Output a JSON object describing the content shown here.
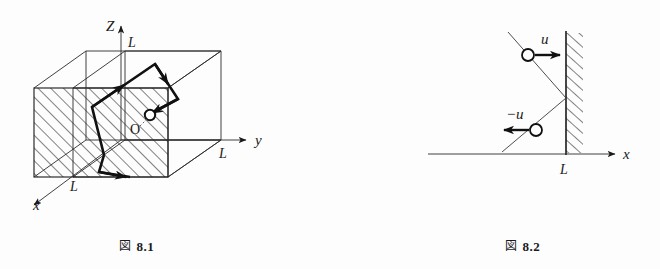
{
  "page": {
    "background_color": "#fdfdfd",
    "ink_color": "#1a1a1a",
    "width": 660,
    "height": 269
  },
  "figure1": {
    "caption_kanji": "図",
    "caption_number": "8.1",
    "caption_full": "図 8.1",
    "axes": {
      "z_label": "Z",
      "y_label": "y",
      "x_label": "x"
    },
    "length_labels": {
      "z_length": "L",
      "y_length": "L",
      "x_length": "L"
    },
    "origin_label": "O",
    "description_items": {
      "cube": "cube-of-side-L",
      "hatched_face": "hatched-square-face",
      "particle": "particle-circle",
      "trajectory": "zigzag-trajectory-with-arrows"
    }
  },
  "figure2": {
    "caption_kanji": "図",
    "caption_number": "8.2",
    "caption_full": "図 8.2",
    "axes": {
      "x_label": "x"
    },
    "length_labels": {
      "wall_position": "L"
    },
    "velocity_incoming": "u",
    "velocity_reflected": "−u",
    "description_items": {
      "wall": "hatched-vertical-wall",
      "incoming_particle": "particle-circle-incoming",
      "reflected_particle": "particle-circle-reflected"
    }
  }
}
